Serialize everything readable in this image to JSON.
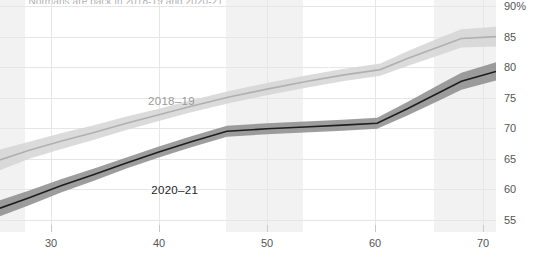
{
  "chart_data": {
    "type": "line",
    "title": "The Normans are back in 2018-19 and 2020-21 Vaccines",
    "xlabel": "",
    "ylabel": "",
    "xlim": [
      25.3,
      71.2
    ],
    "ylim": [
      53.0,
      91.0
    ],
    "xticks": [
      30,
      40,
      50,
      60,
      70
    ],
    "xtick_labels": [
      "30",
      "40",
      "50",
      "60",
      "70"
    ],
    "yticks": [
      55,
      60,
      65,
      70,
      75,
      80,
      85,
      90
    ],
    "ytick_labels": [
      "55",
      "60",
      "65",
      "70",
      "75",
      "80",
      "85",
      "90%"
    ],
    "grid": true,
    "legend": "inline-annotation",
    "shaded_bands": [
      {
        "x0": 25.3,
        "x1": 27.6
      },
      {
        "x0": 46.2,
        "x1": 53.3
      },
      {
        "x0": 65.5,
        "x1": 71.2
      }
    ],
    "series": [
      {
        "name": "2018–19",
        "color": "#b0b0b0",
        "band_color": "#d5d5d5",
        "label_x": 39.0,
        "label_y": 74.5,
        "x": [
          25.3,
          28.0,
          31.0,
          34.0,
          37.0,
          40.0,
          43.0,
          46.5,
          50.0,
          53.5,
          57.0,
          60.5,
          63.0,
          66.0,
          68.0,
          71.2
        ],
        "y": [
          64.8,
          66.4,
          67.9,
          69.3,
          70.8,
          72.2,
          73.6,
          75.1,
          76.4,
          77.6,
          78.7,
          79.6,
          81.4,
          83.4,
          84.7,
          85.0
        ],
        "band_lower": [
          63.1,
          65.0,
          66.6,
          68.1,
          69.7,
          71.2,
          72.6,
          74.1,
          75.4,
          76.6,
          77.7,
          78.6,
          80.2,
          82.0,
          83.2,
          83.4
        ],
        "band_upper": [
          66.5,
          67.8,
          69.2,
          70.5,
          71.9,
          73.2,
          74.6,
          76.1,
          77.4,
          78.6,
          79.7,
          80.6,
          82.6,
          84.8,
          86.2,
          86.6
        ]
      },
      {
        "name": "2020–21",
        "color": "#1e1e1e",
        "band_color": "#8c8c8c",
        "label_x": 39.3,
        "label_y": 59.8,
        "x": [
          25.3,
          28.0,
          31.0,
          34.0,
          37.0,
          40.0,
          43.0,
          46.3,
          50.0,
          53.5,
          57.0,
          60.2,
          63.0,
          66.0,
          68.0,
          71.2
        ],
        "y": [
          56.9,
          58.6,
          60.6,
          62.4,
          64.3,
          66.1,
          67.8,
          69.5,
          69.9,
          70.2,
          70.5,
          70.8,
          73.2,
          75.9,
          77.7,
          79.3
        ],
        "band_lower": [
          55.6,
          57.4,
          59.5,
          61.4,
          63.4,
          65.2,
          66.9,
          68.6,
          69.0,
          69.3,
          69.6,
          69.9,
          72.1,
          74.6,
          76.3,
          77.8
        ],
        "band_upper": [
          58.2,
          59.8,
          61.7,
          63.4,
          65.2,
          67.0,
          68.7,
          70.4,
          70.8,
          71.1,
          71.4,
          71.7,
          74.3,
          77.2,
          79.1,
          80.8
        ]
      }
    ]
  }
}
